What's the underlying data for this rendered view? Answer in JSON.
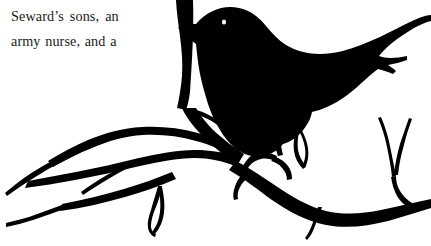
{
  "page": {
    "background_color": "#ffffff",
    "width": 431,
    "height": 246
  },
  "text_block": {
    "color": "#1a1a1a",
    "line_1": "Seward’s sons, an",
    "line_2": "army nurse, and a"
  },
  "illustration": {
    "name": "crow-on-branch-silhouette",
    "ink_color": "#000000",
    "eye_color": "#ffffff",
    "description": "Black silhouette of a crow perched on a bare forked tree branch",
    "parts": [
      "crow-body",
      "crow-head",
      "crow-beak",
      "crow-eye",
      "crow-wing",
      "crow-tail",
      "crow-legs",
      "branch-main",
      "branch-twigs"
    ]
  }
}
